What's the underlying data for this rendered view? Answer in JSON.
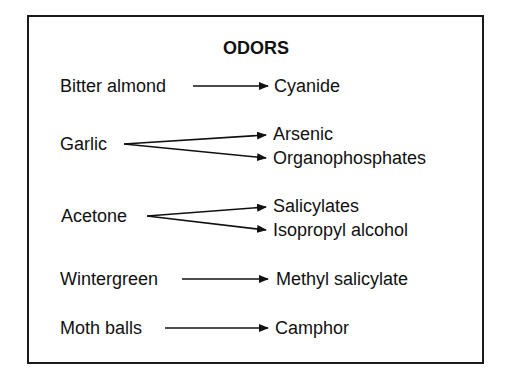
{
  "title": "ODORS",
  "rows": [
    {
      "odor": "Bitter almond",
      "causes": [
        "Cyanide"
      ]
    },
    {
      "odor": "Garlic",
      "causes": [
        "Arsenic",
        "Organophosphates"
      ]
    },
    {
      "odor": "Acetone",
      "causes": [
        "Salicylates",
        "Isopropyl alcohol"
      ]
    },
    {
      "odor": "Wintergreen",
      "causes": [
        "Methyl salicylate"
      ]
    },
    {
      "odor": "Moth balls",
      "causes": [
        "Camphor"
      ]
    }
  ]
}
